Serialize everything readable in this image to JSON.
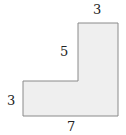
{
  "diagram": {
    "type": "L-shaped polygon",
    "fill": "#efefef",
    "stroke": "#8a8a8a",
    "labels": {
      "top": "3",
      "inner_vertical": "5",
      "left": "3",
      "bottom": "7"
    }
  }
}
